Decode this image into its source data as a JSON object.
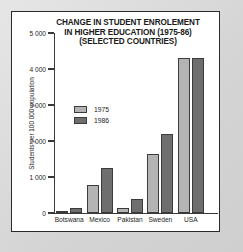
{
  "chart_data": {
    "type": "bar",
    "title": "CHANGE IN STUDENT ENROLEMENT IN HIGHER EDUCATION (1975-86) (SELECTED COUNTRIES)",
    "title_lines": [
      "CHANGE IN STUDENT ENROLEMENT",
      "IN HIGHER EDUCATION (1975-86)",
      "(SELECTED COUNTRIES)"
    ],
    "xlabel": "",
    "ylabel": "Students per 100 000 population",
    "ylim": [
      0,
      5000
    ],
    "ytick_values": [
      0,
      1000,
      2000,
      3000,
      4000,
      5000
    ],
    "ytick_labels": [
      "0",
      "1 000",
      "2 000",
      "3 000",
      "4 000",
      "5 000"
    ],
    "grid": false,
    "legend_position": "inside-left",
    "categories": [
      "Botswana",
      "Mexico",
      "Pakistan",
      "Sweden",
      "USA"
    ],
    "series": [
      {
        "name": "1975",
        "color": "#b4b4b4",
        "values": [
          60,
          780,
          130,
          1640,
          4300
        ]
      },
      {
        "name": "1986",
        "color": "#6e6e6e",
        "values": [
          130,
          1250,
          400,
          2200,
          4300
        ]
      }
    ]
  },
  "colors": {
    "panel_background": "#ffffff",
    "page_background": "#d9d9d9",
    "axis": "#3a3a3a",
    "bar_1975": "#b4b4b4",
    "bar_1986": "#6e6e6e",
    "text": "#1c1c1c"
  }
}
